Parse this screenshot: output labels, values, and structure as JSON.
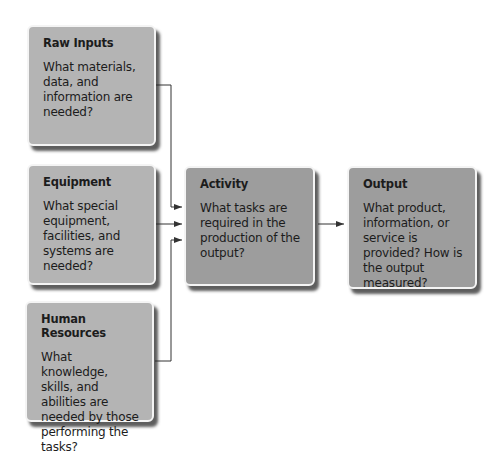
{
  "diagram": {
    "boxes": {
      "raw_inputs": {
        "title": "Raw Inputs",
        "body": "What materials, data, and information are needed?"
      },
      "equipment": {
        "title": "Equipment",
        "body": "What special equipment, facilities, and systems are needed?"
      },
      "human_resources": {
        "title": "Human Resources",
        "body": "What knowledge, skills, and abilities are needed by those performing the tasks?"
      },
      "activity": {
        "title": "Activity",
        "body": "What tasks are required in the production of the output?"
      },
      "output": {
        "title": "Output",
        "body": "What product, information, or service is provided? How is the output measured?"
      }
    },
    "edges": [
      {
        "from": "raw_inputs",
        "to": "activity"
      },
      {
        "from": "equipment",
        "to": "activity"
      },
      {
        "from": "human_resources",
        "to": "activity"
      },
      {
        "from": "activity",
        "to": "output"
      }
    ],
    "colors": {
      "input_box": "#b4b4b4",
      "process_box": "#9d9d9d",
      "connector": "#333333"
    }
  }
}
